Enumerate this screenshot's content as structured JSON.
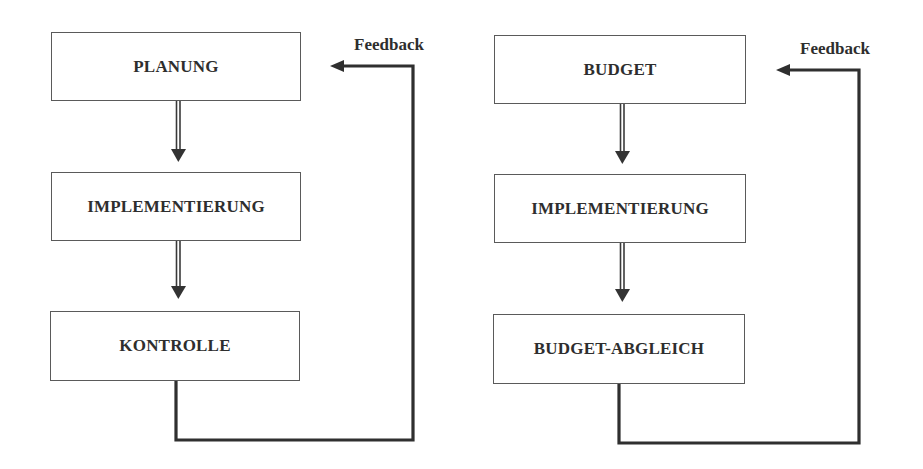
{
  "diagrams": [
    {
      "name": "management-cycle",
      "steps": [
        {
          "label": "PLANUNG"
        },
        {
          "label": "IMPLEMENTIERUNG"
        },
        {
          "label": "KONTROLLE"
        }
      ],
      "feedback_label": "Feedback"
    },
    {
      "name": "budget-cycle",
      "steps": [
        {
          "label": "BUDGET"
        },
        {
          "label": "IMPLEMENTIERUNG"
        },
        {
          "label": "BUDGET-ABGLEICH"
        }
      ],
      "feedback_label": "Feedback"
    }
  ],
  "colors": {
    "line": "#2f2f2f",
    "box_border": "#5a5a5a",
    "text": "#2e2e2e"
  }
}
